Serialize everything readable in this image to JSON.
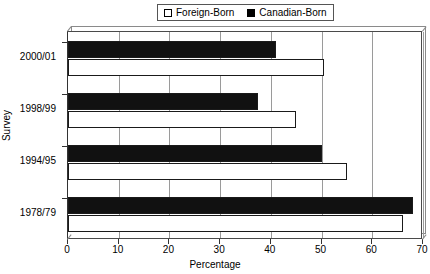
{
  "chart_data": {
    "type": "bar",
    "orientation": "horizontal",
    "title": "",
    "xlabel": "Percentage",
    "ylabel": "Survey",
    "categories": [
      "2000/01",
      "1998/99",
      "1994/95",
      "1978/79"
    ],
    "series": [
      {
        "name": "Foreign-Born",
        "color": "#ffffff",
        "values": [
          50.5,
          45.0,
          55.0,
          66.0
        ]
      },
      {
        "name": "Canadian-Born",
        "color": "#000000",
        "values": [
          41.0,
          37.5,
          50.0,
          68.0
        ]
      }
    ],
    "xlim": [
      0,
      70
    ],
    "xticks": [
      0,
      10,
      20,
      30,
      40,
      50,
      60,
      70
    ],
    "xticklabels": [
      "0",
      "10",
      "20",
      "30",
      "40",
      "50",
      "60",
      "70"
    ],
    "grid": true,
    "grid_axis": "x",
    "legend_position": "top-center"
  },
  "legend": {
    "entries": [
      {
        "label": "Foreign-Born",
        "swatch": "open-square-icon"
      },
      {
        "label": "Canadian-Born",
        "swatch": "filled-square-icon"
      }
    ]
  }
}
